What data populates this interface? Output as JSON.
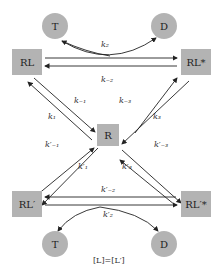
{
  "nodes": {
    "T_top": "T",
    "D_top": "D",
    "RL": "RL",
    "RL_star": "RL*",
    "R": "R",
    "RLp": "RL′",
    "RLp_star": "RL′*",
    "T_bottom": "T",
    "D_bottom": "D"
  },
  "rates": {
    "k2": "k₂",
    "km2": "k₋₂",
    "km1": "k₋₁",
    "km3": "k₋₃",
    "k1": "k₁",
    "k3": "k₃",
    "kpm1": "k′₋₁",
    "kp1": "k′₁",
    "kp3": "k′₃",
    "kpm3": "k′₋₃",
    "kpm2": "k′₋₂",
    "kp2": "k′₂"
  },
  "footer": "[L]=[L′]",
  "colors": {
    "node_fill": "#b3b3b3",
    "arrow": "#222222"
  }
}
